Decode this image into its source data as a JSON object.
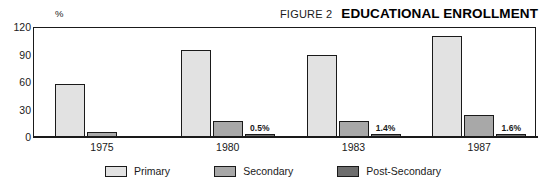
{
  "header": {
    "figure_number": "FIGURE 2",
    "title": "EDUCATIONAL ENROLLMENT"
  },
  "axis": {
    "unit": "%",
    "yticks": [
      "120",
      "90",
      "60",
      "30",
      "0"
    ]
  },
  "legend": {
    "items": [
      {
        "label": "Primary",
        "color": "#e2e2e2"
      },
      {
        "label": "Secondary",
        "color": "#a8a8a8"
      },
      {
        "label": "Post-Secondary",
        "color": "#6e6e6e"
      }
    ]
  },
  "chart_data": {
    "type": "bar",
    "title": "EDUCATIONAL ENROLLMENT",
    "subtitle": "FIGURE 2",
    "xlabel": "",
    "ylabel": "%",
    "ylim": [
      0,
      120
    ],
    "yticks": [
      0,
      30,
      60,
      90,
      120
    ],
    "grid": false,
    "legend_position": "bottom",
    "categories": [
      "1975",
      "1980",
      "1983",
      "1987"
    ],
    "series": [
      {
        "name": "Primary",
        "color": "#e2e2e2",
        "values": [
          58,
          95,
          89,
          110
        ],
        "data_labels": [
          "",
          "",
          "",
          ""
        ]
      },
      {
        "name": "Secondary",
        "color": "#a8a8a8",
        "values": [
          6,
          17,
          17,
          24
        ],
        "data_labels": [
          "",
          "",
          "",
          ""
        ]
      },
      {
        "name": "Post-Secondary",
        "color": "#6e6e6e",
        "values": [
          0,
          0.5,
          1.4,
          1.6
        ],
        "data_labels": [
          "",
          "0.5%",
          "1.4%",
          "1.6%"
        ]
      }
    ]
  }
}
